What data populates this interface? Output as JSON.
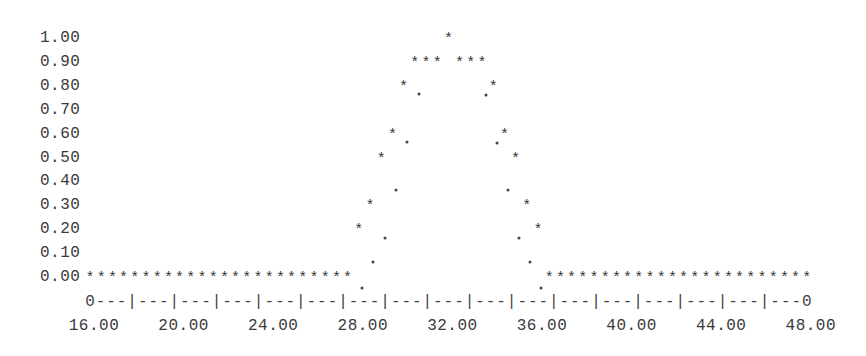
{
  "chart_data": {
    "type": "scatter",
    "style": "ascii-line-printer",
    "title": "",
    "xlabel": "",
    "ylabel": "",
    "xlim": [
      16,
      48
    ],
    "ylim": [
      0,
      1
    ],
    "grid": false,
    "legend": null,
    "marker": "*",
    "connector_marker": ".",
    "y_ticks": [
      "1.00",
      "0.90",
      "0.80",
      "0.70",
      "0.60",
      "0.50",
      "0.40",
      "0.30",
      "0.20",
      "0.10",
      "0.00"
    ],
    "x_ticks": [
      "16.00",
      "20.00",
      "24.00",
      "28.00",
      "32.00",
      "36.00",
      "40.00",
      "44.00",
      "48.00"
    ],
    "x_axis_line": "0---|---|---|---|---|---|---|---|---|---|---|---|---|---|---|---|---0",
    "series": [
      {
        "name": "membership",
        "x": [
          16.0,
          16.5,
          17.0,
          17.5,
          18.0,
          18.5,
          19.0,
          19.5,
          20.0,
          20.5,
          21.0,
          21.5,
          22.0,
          22.5,
          23.0,
          23.5,
          24.0,
          24.5,
          25.0,
          25.5,
          26.0,
          26.5,
          27.0,
          27.5,
          28.0,
          28.5,
          29.0,
          29.5,
          30.0,
          30.5,
          31.0,
          31.5,
          32.0,
          32.5,
          33.0,
          33.5,
          34.0,
          34.5,
          35.0,
          35.5,
          36.0,
          36.5,
          37.0,
          37.5,
          38.0,
          38.5,
          39.0,
          39.5,
          40.0,
          40.5,
          41.0,
          41.5,
          42.0,
          42.5,
          43.0,
          43.5,
          44.0,
          44.5,
          45.0,
          45.5,
          46.0,
          46.5,
          47.0,
          47.5,
          48.0
        ],
        "values": [
          0,
          0,
          0,
          0,
          0,
          0,
          0,
          0,
          0,
          0,
          0,
          0,
          0,
          0,
          0,
          0,
          0,
          0,
          0,
          0,
          0,
          0,
          0,
          0,
          0.2,
          0.3,
          0.5,
          0.6,
          0.8,
          0.9,
          0.9,
          0.9,
          1.0,
          0.9,
          0.9,
          0.9,
          0.8,
          0.6,
          0.5,
          0.3,
          0.2,
          0,
          0,
          0,
          0,
          0,
          0,
          0,
          0,
          0,
          0,
          0,
          0,
          0,
          0,
          0,
          0,
          0,
          0,
          0,
          0,
          0,
          0,
          0,
          0
        ]
      }
    ],
    "connector_dots": [
      {
        "x": 28.0,
        "px": 362,
        "py": 288
      },
      {
        "x": 28.5,
        "px": 373,
        "py": 262
      },
      {
        "x": 29.0,
        "px": 385,
        "py": 238
      },
      {
        "x": 29.5,
        "px": 396,
        "py": 190
      },
      {
        "x": 30.0,
        "px": 407,
        "py": 142
      },
      {
        "x": 30.5,
        "px": 419,
        "py": 94
      },
      {
        "x": 33.5,
        "px": 486,
        "py": 95
      },
      {
        "x": 34.0,
        "px": 497,
        "py": 143
      },
      {
        "x": 34.5,
        "px": 508,
        "py": 190
      },
      {
        "x": 35.0,
        "px": 519,
        "py": 238
      },
      {
        "x": 35.5,
        "px": 530,
        "py": 262
      },
      {
        "x": 36.0,
        "px": 541,
        "py": 288
      }
    ]
  }
}
